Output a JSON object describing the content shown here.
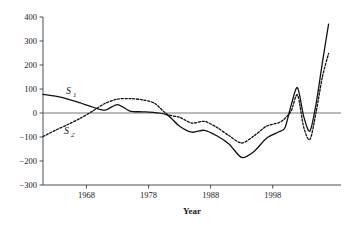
{
  "chart_data": {
    "type": "line",
    "title": "",
    "xlabel": "Year",
    "ylabel": "",
    "xlim": [
      1961,
      2009
    ],
    "ylim": [
      -300,
      400
    ],
    "grid": false,
    "legend_position": "inline-annotation",
    "y_ticks": [
      400,
      300,
      200,
      100,
      0,
      -100,
      -200,
      -300
    ],
    "y_tick_labels": [
      "400",
      "300",
      "200",
      "100",
      "0",
      "−100",
      "−200",
      "−300"
    ],
    "x_ticks": [
      1968,
      1978,
      1988,
      1998
    ],
    "x_tick_labels": [
      "1968",
      "1978",
      "1988",
      "1998"
    ],
    "zero_reference_line": 0,
    "annotations": [
      {
        "text": "S",
        "subscript": "1",
        "series": "S1",
        "x": 1966,
        "y": 120
      },
      {
        "text": "S",
        "subscript": "2",
        "series": "S2",
        "x": 1966,
        "y": -75
      }
    ],
    "series": [
      {
        "name": "S1",
        "label": "S_1",
        "style": "solid",
        "x": [
          1961,
          1963,
          1965,
          1967,
          1969,
          1971,
          1973,
          1975,
          1977,
          1979,
          1981,
          1983,
          1985,
          1987,
          1989,
          1991,
          1993,
          1995,
          1997,
          1999,
          2000,
          2001,
          2002,
          2003,
          2004,
          2005,
          2006,
          2007
        ],
        "values": [
          78,
          70,
          58,
          42,
          25,
          12,
          35,
          8,
          5,
          2,
          -8,
          -55,
          -80,
          -72,
          -95,
          -130,
          -185,
          -160,
          -105,
          -78,
          -60,
          35,
          105,
          -15,
          -75,
          40,
          210,
          370
        ]
      },
      {
        "name": "S2",
        "label": "S_2",
        "style": "dashed",
        "x": [
          1961,
          1963,
          1965,
          1967,
          1969,
          1971,
          1973,
          1975,
          1977,
          1979,
          1981,
          1983,
          1985,
          1987,
          1989,
          1991,
          1993,
          1995,
          1997,
          1999,
          2000,
          2001,
          2002,
          2003,
          2004,
          2005,
          2006,
          2007
        ],
        "values": [
          -98,
          -72,
          -48,
          -22,
          8,
          40,
          58,
          60,
          55,
          40,
          -5,
          -18,
          -42,
          -35,
          -60,
          -95,
          -125,
          -95,
          -55,
          -40,
          -22,
          10,
          75,
          -60,
          -110,
          5,
          150,
          248
        ]
      }
    ]
  },
  "axes": {
    "plot_left": 43,
    "plot_right": 341,
    "plot_top": 17,
    "plot_bottom": 185
  }
}
